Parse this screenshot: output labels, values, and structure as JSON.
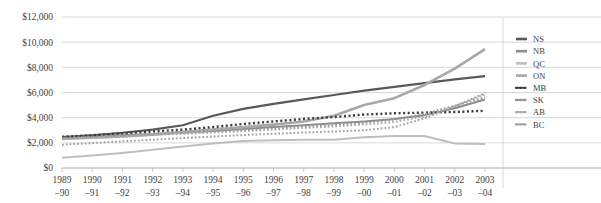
{
  "chart_data": {
    "type": "line",
    "title": "",
    "subtitle": "",
    "xlabel": "",
    "ylabel": "",
    "ylim": [
      0,
      12000
    ],
    "ytick_values": [
      0,
      2000,
      4000,
      6000,
      8000,
      10000,
      12000
    ],
    "ytick_labels": [
      "$0",
      "$2,000",
      "$4,000",
      "$6,000",
      "$8,000",
      "$10,000",
      "$12,000"
    ],
    "grid": true,
    "legend_position": "right",
    "categories": [
      "1989–90",
      "1990–91",
      "1991–92",
      "1992–93",
      "1993–94",
      "1994–95",
      "1995–96",
      "1996–97",
      "1997–98",
      "1998–99",
      "1999–00",
      "2000–01",
      "2001–02",
      "2002–03",
      "2003–04"
    ],
    "category_lines": [
      [
        "1989",
        "–90"
      ],
      [
        "1990",
        "–91"
      ],
      [
        "1991",
        "–92"
      ],
      [
        "1992",
        "–93"
      ],
      [
        "1993",
        "–94"
      ],
      [
        "1994",
        "–95"
      ],
      [
        "1995",
        "–96"
      ],
      [
        "1996",
        "–97"
      ],
      [
        "1997",
        "–98"
      ],
      [
        "1998",
        "–99"
      ],
      [
        "1999",
        "–00"
      ],
      [
        "2000",
        "–01"
      ],
      [
        "2001",
        "–02"
      ],
      [
        "2002",
        "–03"
      ],
      [
        "2003",
        "–04"
      ]
    ],
    "series": [
      {
        "name": "NS",
        "color": "#58595b",
        "width": 2.2,
        "dash": "none",
        "values": [
          2450,
          2600,
          2800,
          3050,
          3400,
          4150,
          4700,
          5100,
          5450,
          5800,
          6150,
          6450,
          6750,
          7050,
          7300
        ]
      },
      {
        "name": "NB",
        "color": "#8d8e90",
        "width": 2.0,
        "dash": "none",
        "values": [
          2350,
          2450,
          2600,
          2700,
          2800,
          2950,
          3100,
          3250,
          3400,
          3550,
          3700,
          3900,
          4200,
          4750,
          5450
        ]
      },
      {
        "name": "QC",
        "color": "#bdbec0",
        "width": 2.0,
        "dash": "none",
        "values": [
          820,
          1000,
          1200,
          1450,
          1700,
          1950,
          2150,
          2200,
          2250,
          2250,
          2450,
          2550,
          2550,
          1950,
          1900
        ]
      },
      {
        "name": "ON",
        "color": "#a6a8ab",
        "width": 2.6,
        "dash": "none",
        "values": [
          2300,
          2400,
          2500,
          2650,
          2850,
          3050,
          3250,
          3450,
          3700,
          4150,
          5000,
          5550,
          6600,
          7900,
          9450
        ]
      },
      {
        "name": "MB",
        "color": "#3b3c3e",
        "width": 2.4,
        "dash": "dot",
        "values": [
          2480,
          2600,
          2750,
          2900,
          3050,
          3250,
          3500,
          3700,
          3900,
          4050,
          4250,
          4350,
          4400,
          4450,
          4550
        ]
      },
      {
        "name": "SK",
        "color": "#919295",
        "width": 2.0,
        "dash": "dot",
        "values": [
          2400,
          2480,
          2580,
          2680,
          2780,
          2880,
          3000,
          3120,
          3250,
          3400,
          3600,
          3850,
          4300,
          4950,
          5600
        ]
      },
      {
        "name": "AB",
        "color": "#a9abad",
        "width": 2.0,
        "dash": "dot",
        "values": [
          2300,
          2400,
          2500,
          2620,
          2720,
          2820,
          2920,
          3050,
          3180,
          3300,
          3450,
          3650,
          4100,
          4900,
          5850
        ]
      },
      {
        "name": "BC",
        "color": "#9c9ea0",
        "width": 2.0,
        "dash": "dot",
        "values": [
          1850,
          1980,
          2120,
          2250,
          2380,
          2500,
          2620,
          2720,
          2820,
          2900,
          3000,
          3250,
          3950,
          4900,
          5950
        ]
      }
    ],
    "legend_entries": [
      {
        "label": "NS",
        "color": "#58595b",
        "dash": "none"
      },
      {
        "label": "NB",
        "color": "#8d8e90",
        "dash": "none"
      },
      {
        "label": "QC",
        "color": "#bdbec0",
        "dash": "none"
      },
      {
        "label": "ON",
        "color": "#a6a8ab",
        "dash": "none"
      },
      {
        "label": "MB",
        "color": "#3b3c3e",
        "dash": "dot"
      },
      {
        "label": "SK",
        "color": "#919295",
        "dash": "dot"
      },
      {
        "label": "AB",
        "color": "#a9abad",
        "dash": "dot"
      },
      {
        "label": "BC",
        "color": "#9c9ea0",
        "dash": "dot"
      }
    ]
  }
}
